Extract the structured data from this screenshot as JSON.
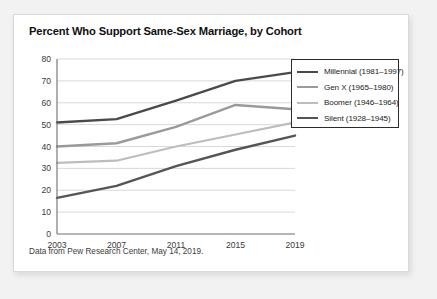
{
  "card": {
    "title": "Percent Who Support Same-Sex Marriage, by Cohort",
    "caption": "Data from Pew Research Center, May 14, 2019."
  },
  "legend": {
    "position": "top-right",
    "items": [
      {
        "label": "Millennial (1981–1997)",
        "color": "#4a4a4a"
      },
      {
        "label": "Gen X (1965–1980)",
        "color": "#9a9a9a"
      },
      {
        "label": "Boomer (1946–1964)",
        "color": "#bdbdbd"
      },
      {
        "label": "Silent (1928–1945)",
        "color": "#555555"
      }
    ]
  },
  "axes": {
    "y_ticks": [
      "0",
      "10",
      "20",
      "30",
      "40",
      "50",
      "60",
      "70",
      "80"
    ],
    "x_ticks": [
      "2003",
      "2007",
      "2011",
      "2015",
      "2019"
    ]
  },
  "chart_data": {
    "type": "line",
    "title": "Percent Who Support Same-Sex Marriage, by Cohort",
    "subtitle": "",
    "xlabel": "",
    "ylabel": "",
    "x": [
      2003,
      2007,
      2011,
      2015,
      2019
    ],
    "categories": [
      "2003",
      "2007",
      "2011",
      "2015",
      "2019"
    ],
    "series": [
      {
        "name": "Millennial (1981–1997)",
        "values": [
          51,
          52.5,
          61,
          70,
          74
        ],
        "color": "#4a4a4a"
      },
      {
        "name": "Gen X (1965–1980)",
        "values": [
          40,
          41.5,
          49,
          59,
          57
        ],
        "color": "#9a9a9a"
      },
      {
        "name": "Boomer (1946–1964)",
        "values": [
          32.5,
          33.5,
          40,
          45.5,
          51
        ],
        "color": "#bdbdbd"
      },
      {
        "name": "Silent (1928–1945)",
        "values": [
          16.5,
          22,
          31,
          38.5,
          45
        ],
        "color": "#555555"
      }
    ],
    "ylim": [
      0,
      80
    ],
    "ytick_step": 10,
    "xlim": [
      2003,
      2019
    ],
    "grid": "horizontal",
    "legend_position": "top-right",
    "annotations": [
      "Data from Pew Research Center, May 14, 2019."
    ]
  }
}
